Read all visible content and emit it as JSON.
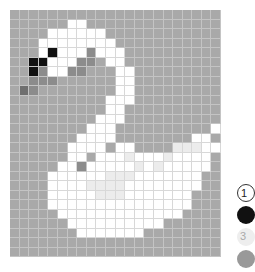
{
  "puzzle": {
    "title": "Swan pixel art",
    "columns": 22,
    "rows": 26,
    "palette": {
      "g": "#a9a9a9",
      "w": "#ffffff",
      "k": "#111111",
      "d": "#6f6f6f",
      "m": "#8c8c8c",
      "l": "#ececec"
    },
    "grid": [
      "gggggggggggggggggggggg",
      "ggggggwwgggggggggggggg",
      "ggggwwwwwwgggggggggggg",
      "gggwwwwwwwwggggggggggg",
      "gggwkwwwmwwwgggggggggg",
      "ggkkwwwmmgwwgggggggggg",
      "ggkmwwmmgggwwggggggggg",
      "ggmmmggggggwwggggggggg",
      "gdmggggggggwwggggggggg",
      "ggggggggggwwwggggggggg",
      "ggggggggggwwgggggggggg",
      "gggggggggwwwgggggggggg",
      "ggggggggwwwggggggggggw",
      "gggggggwwwwggggggggwwg",
      "ggggggwwwwgwwgggglllww",
      "ggggggwwgwwwlwwwlwwwwg",
      "gggggwwmwwwwwlwlwwwwwg",
      "ggggwwwwwwlllwwwwwwwgg",
      "ggggwwwwllllwwwwwwwwgg",
      "ggggwwwwwlllwwwwwwwggg",
      "ggggwwwwwwwwwwwwwwwggg",
      "gggggwwwwwwwwwwwwwgggg",
      "ggggggwwwwwwwwwwgggggg",
      "gggggggwwwwwwwgggggggg",
      "gggggggggggggggggggggg",
      "gggggggggggggggggggggg"
    ]
  },
  "legend": [
    {
      "key": "1",
      "label": "1",
      "type": "number"
    },
    {
      "key": "black",
      "label": "",
      "type": "color"
    },
    {
      "key": "3",
      "label": "3",
      "type": "number-light"
    },
    {
      "key": "gray",
      "label": "",
      "type": "color"
    }
  ]
}
